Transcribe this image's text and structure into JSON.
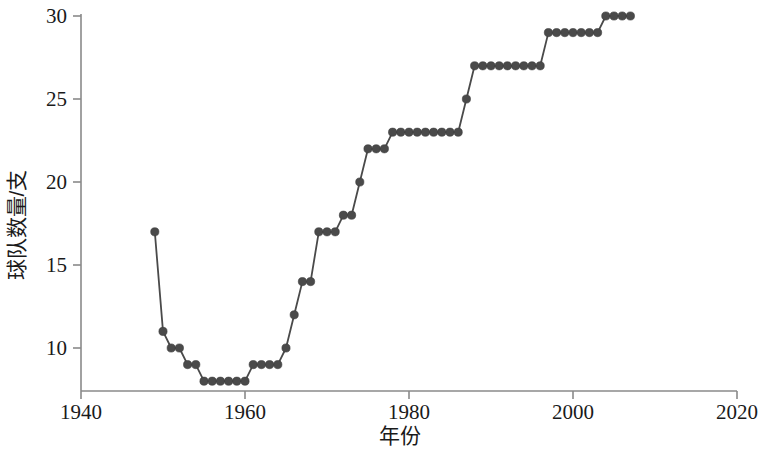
{
  "chart_data": {
    "type": "line",
    "title": "",
    "xlabel": "年份",
    "ylabel": "球队数量/支",
    "xlim": [
      1940,
      2020
    ],
    "ylim": [
      7,
      30.6
    ],
    "xticks": [
      1940,
      1960,
      1980,
      2000,
      2020
    ],
    "yticks": [
      10,
      15,
      20,
      25,
      30
    ],
    "xtick_labels": [
      "1940",
      "1960",
      "1980",
      "2000",
      "2020"
    ],
    "ytick_labels": [
      "10",
      "15",
      "20",
      "25",
      "30"
    ],
    "grid": false,
    "legend": "none",
    "marker": "circle",
    "series_color": "#4a4a4a",
    "x": [
      1949,
      1950,
      1951,
      1952,
      1953,
      1954,
      1955,
      1956,
      1957,
      1958,
      1959,
      1960,
      1961,
      1962,
      1963,
      1964,
      1965,
      1966,
      1967,
      1968,
      1969,
      1970,
      1971,
      1972,
      1973,
      1974,
      1975,
      1976,
      1977,
      1978,
      1979,
      1980,
      1981,
      1982,
      1983,
      1984,
      1985,
      1986,
      1987,
      1988,
      1989,
      1990,
      1991,
      1992,
      1993,
      1994,
      1995,
      1996,
      1997,
      1998,
      1999,
      2000,
      2001,
      2002,
      2003,
      2004,
      2005,
      2006,
      2007
    ],
    "values": [
      17,
      11,
      10,
      10,
      9,
      9,
      8,
      8,
      8,
      8,
      8,
      8,
      9,
      9,
      9,
      9,
      10,
      12,
      14,
      14,
      17,
      17,
      17,
      18,
      18,
      20,
      22,
      22,
      22,
      23,
      23,
      23,
      23,
      23,
      23,
      23,
      23,
      23,
      25,
      27,
      27,
      27,
      27,
      27,
      27,
      27,
      27,
      27,
      29,
      29,
      29,
      29,
      29,
      29,
      29,
      30,
      30,
      30,
      30
    ]
  },
  "axes": {
    "y_label": "球队数量/支",
    "x_label": "年份"
  }
}
